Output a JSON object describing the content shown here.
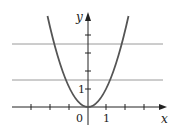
{
  "graph": {
    "function": "y = x^2",
    "x_axis_label": "x",
    "y_axis_label": "y",
    "origin_label": "0",
    "x_tick_label": "1",
    "y_tick_label": "1",
    "horizontal_lines": [
      {
        "y": 3.5
      },
      {
        "y": 1.5
      }
    ],
    "colors": {
      "axes": "#222222",
      "curve": "#555555",
      "horizontal_lines": "#9a9a9a"
    }
  }
}
